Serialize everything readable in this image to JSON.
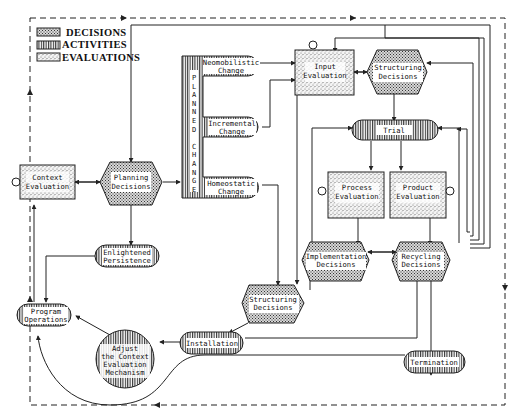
{
  "legend": {
    "items": [
      {
        "label": "DECISIONS",
        "pattern": "decision"
      },
      {
        "label": "ACTIVITIES",
        "pattern": "activity"
      },
      {
        "label": "EVALUATIONS",
        "pattern": "evaluation"
      }
    ]
  },
  "nodes": {
    "context_evaluation": {
      "line1": "Context",
      "line2": "Evaluation",
      "type": "evaluation"
    },
    "planning_decisions": {
      "line1": "Planning",
      "line2": "Decisions",
      "type": "decision"
    },
    "planned_change": {
      "label": "PLANNED CHANGE",
      "type": "activity"
    },
    "neomobilistic_change": {
      "line1": "Neomobilistic",
      "line2": "Change",
      "type": "activity"
    },
    "incremental_change": {
      "line1": "Incremental",
      "line2": "Change",
      "type": "activity"
    },
    "homeostatic_change": {
      "line1": "Homeostatic",
      "line2": "Change",
      "type": "activity"
    },
    "input_evaluation": {
      "line1": "Input",
      "line2": "Evaluation",
      "type": "evaluation"
    },
    "structuring_decisions_top": {
      "line1": "Structuring",
      "line2": "Decisions",
      "type": "decision"
    },
    "trial": {
      "line1": "Trial",
      "type": "activity"
    },
    "process_evaluation": {
      "line1": "Process",
      "line2": "Evaluation",
      "type": "evaluation"
    },
    "product_evaluation": {
      "line1": "Product",
      "line2": "Evaluation",
      "type": "evaluation"
    },
    "implementation_decisions": {
      "line1": "Implementation",
      "line2": "Decisions",
      "type": "decision"
    },
    "recycling_decisions": {
      "line1": "Recycling",
      "line2": "Decisions",
      "type": "decision"
    },
    "enlightened_persistence": {
      "line1": "Enlightened",
      "line2": "Persistence",
      "type": "activity"
    },
    "structuring_decisions_bottom": {
      "line1": "Structuring",
      "line2": "Decisions",
      "type": "decision"
    },
    "program_operations": {
      "line1": "Program",
      "line2": "Operations",
      "type": "activity"
    },
    "adjust_mechanism": {
      "line1": "Adjust",
      "line2": "the Context",
      "line3": "Evaluation",
      "line4": "Mechanism",
      "type": "activity"
    },
    "installation": {
      "line1": "Installation",
      "type": "activity"
    },
    "termination": {
      "line1": "Termination",
      "type": "activity"
    }
  },
  "planned_change_letters": [
    "P",
    "L",
    "A",
    "N",
    "N",
    "E",
    "D",
    "",
    "C",
    "H",
    "A",
    "N",
    "G",
    "E"
  ],
  "colors": {
    "ink": "#222222",
    "background": "#ffffff"
  }
}
